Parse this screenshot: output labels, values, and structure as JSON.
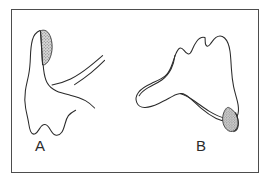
{
  "figure": {
    "type": "line-drawing",
    "frame": {
      "x": 11,
      "y": 9,
      "width": 248,
      "height": 164,
      "border_color": "#4d4d4d",
      "border_width": 1,
      "background": "#ffffff"
    },
    "stroke_color": "#2b2b2b",
    "stipple_color": "#6e6e6e",
    "stipple_fill": "#cfcfcf",
    "panels": [
      {
        "id": "A",
        "label": "A",
        "label_x": 35,
        "label_y": 138,
        "description": "tooth in lateral/mesial view with long root extending to upper right and a shaded facet on the upper cusp",
        "facet": "upper cusp wear facet, stippled"
      },
      {
        "id": "B",
        "label": "B",
        "label_x": 196,
        "label_y": 138,
        "description": "tooth crown in occlusal/buccal view with two cusps and V-shaped cervical margin, shaded facet at lower right",
        "facet": "lower right wear facet, stippled"
      }
    ]
  }
}
